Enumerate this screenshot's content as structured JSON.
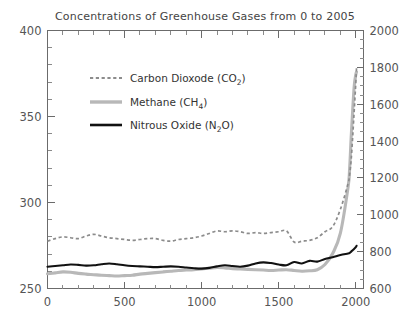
{
  "chart_data": {
    "type": "line",
    "title": "Concentrations of Greenhouse Gases from 0 to 2005",
    "xlabel": "",
    "ylabel": "",
    "ylabel_right": "",
    "xlim": [
      0,
      2050
    ],
    "ylim": [
      250,
      400
    ],
    "ylim_right": [
      600,
      2000
    ],
    "grid": false,
    "legend_position": "upper-left-inside",
    "xticks": [
      0,
      500,
      1000,
      1500,
      2000
    ],
    "xtick_labels": [
      "0",
      "500",
      "1000",
      "1500",
      "2000"
    ],
    "xtick_minor_step": 100,
    "yticks_left": [
      250,
      300,
      350,
      400
    ],
    "ytick_labels_left": [
      "250",
      "300",
      "350",
      "400"
    ],
    "ytick_minor_step": 10,
    "yticks_right": [
      600,
      800,
      1000,
      1200,
      1400,
      1600,
      1800,
      2000
    ],
    "ytick_labels_right": [
      "600",
      "800",
      "1000",
      "1200",
      "1400",
      "1600",
      "1800",
      "2000"
    ],
    "ytick_right_minor_step": 50,
    "series": [
      {
        "name": "Carbon Dioxode (CO2)",
        "label": "Carbon Dioxode (CO",
        "label_sub": "2",
        "label_tail": ")",
        "axis": "left",
        "units": "ppm",
        "style": "dashed",
        "color": "#8c8c8c",
        "x": [
          0,
          50,
          100,
          150,
          200,
          250,
          300,
          350,
          400,
          450,
          500,
          550,
          600,
          650,
          700,
          750,
          800,
          850,
          900,
          950,
          1000,
          1050,
          1100,
          1150,
          1200,
          1250,
          1300,
          1350,
          1400,
          1450,
          1500,
          1550,
          1600,
          1650,
          1700,
          1750,
          1800,
          1850,
          1900,
          1950,
          1960,
          1970,
          1980,
          1990,
          2000,
          2005
        ],
        "y": [
          277.5,
          279.0,
          280.0,
          279.5,
          279.0,
          280.5,
          281.5,
          280.5,
          279.5,
          279.0,
          278.5,
          278.0,
          278.5,
          279.0,
          279.0,
          278.0,
          277.5,
          278.5,
          279.0,
          279.5,
          280.5,
          282.0,
          283.5,
          283.0,
          283.5,
          283.0,
          282.0,
          282.5,
          282.0,
          282.5,
          283.0,
          283.5,
          277.0,
          277.5,
          278.0,
          279.5,
          283.0,
          286.0,
          296.0,
          311.0,
          316.5,
          325.0,
          338.5,
          354.0,
          369.5,
          379.0
        ]
      },
      {
        "name": "Methane (CH4)",
        "label": "Methane (CH",
        "label_sub": "4",
        "label_tail": ")",
        "axis": "right",
        "units": "ppb",
        "style": "solid-thick",
        "color": "#b8b8b8",
        "x": [
          0,
          50,
          100,
          150,
          200,
          250,
          300,
          350,
          400,
          450,
          500,
          550,
          600,
          650,
          700,
          750,
          800,
          850,
          900,
          950,
          1000,
          1050,
          1100,
          1150,
          1200,
          1250,
          1300,
          1350,
          1400,
          1450,
          1500,
          1550,
          1600,
          1650,
          1700,
          1750,
          1800,
          1850,
          1900,
          1950,
          1960,
          1970,
          1980,
          1990,
          2000,
          2005
        ],
        "y": [
          680,
          685,
          690,
          688,
          682,
          678,
          675,
          672,
          670,
          668,
          670,
          672,
          678,
          682,
          686,
          690,
          694,
          698,
          700,
          702,
          706,
          710,
          714,
          712,
          708,
          706,
          704,
          702,
          700,
          698,
          700,
          702,
          698,
          694,
          696,
          702,
          730,
          790,
          900,
          1150,
          1250,
          1420,
          1570,
          1700,
          1760,
          1775
        ]
      },
      {
        "name": "Nitrous Oxide (N2O)",
        "label": "Nitrous Oxide (N",
        "label_sub": "2",
        "label_tail": "O)",
        "axis": "right",
        "units": "ppb",
        "style": "solid",
        "color": "#111111",
        "x": [
          0,
          50,
          100,
          150,
          200,
          250,
          300,
          350,
          400,
          450,
          500,
          550,
          600,
          650,
          700,
          750,
          800,
          850,
          900,
          950,
          1000,
          1050,
          1100,
          1150,
          1200,
          1250,
          1300,
          1350,
          1400,
          1450,
          1500,
          1550,
          1600,
          1650,
          1700,
          1750,
          1800,
          1850,
          1900,
          1950,
          1960,
          1970,
          1980,
          1990,
          2000,
          2005
        ],
        "y": [
          718,
          722,
          726,
          730,
          728,
          724,
          726,
          732,
          736,
          732,
          726,
          722,
          720,
          718,
          716,
          718,
          720,
          718,
          714,
          710,
          708,
          712,
          720,
          726,
          722,
          718,
          724,
          736,
          742,
          738,
          730,
          726,
          744,
          736,
          750,
          746,
          760,
          770,
          782,
          790,
          793,
          800,
          808,
          816,
          824,
          832
        ]
      }
    ],
    "annotations": []
  },
  "legend": {
    "entries": [
      {
        "key": "co2",
        "text": "Carbon Dioxode (CO",
        "sub": "2",
        "tail": ")"
      },
      {
        "key": "ch4",
        "text": "Methane (CH",
        "sub": "4",
        "tail": ")"
      },
      {
        "key": "n2o",
        "text": "Nitrous Oxide (N",
        "sub": "2",
        "tail": "O)"
      }
    ]
  }
}
